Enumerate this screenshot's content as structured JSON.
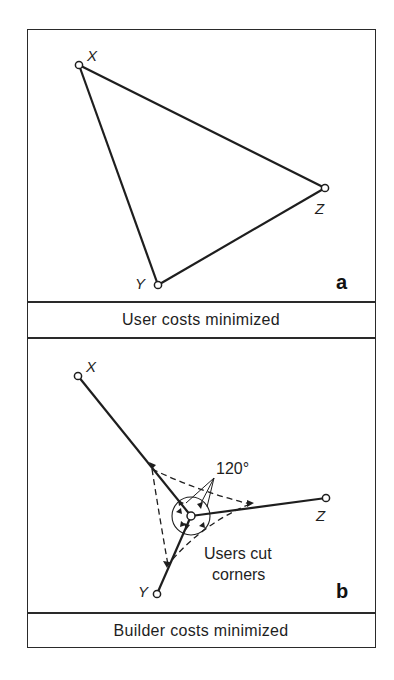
{
  "figure": {
    "panels": [
      {
        "id": "a",
        "letter": "a",
        "caption": "User costs minimized",
        "vertices": [
          {
            "label": "X",
            "x": 79,
            "y": 65
          },
          {
            "label": "Y",
            "x": 158,
            "y": 285
          },
          {
            "label": "Z",
            "x": 325,
            "y": 188
          }
        ],
        "edges": [
          [
            "X",
            "Z"
          ],
          [
            "X",
            "Y"
          ],
          [
            "Y",
            "Z"
          ]
        ]
      },
      {
        "id": "b",
        "letter": "b",
        "caption": "Builder costs minimized",
        "vertices": [
          {
            "label": "X",
            "x": 78,
            "y": 376
          },
          {
            "label": "Y",
            "x": 157,
            "y": 594
          },
          {
            "label": "Z",
            "x": 326,
            "y": 498
          }
        ],
        "junction": {
          "x": 191,
          "y": 516
        },
        "edges": [
          [
            "X",
            "junction"
          ],
          [
            "Y",
            "junction"
          ],
          [
            "Z",
            "junction"
          ]
        ],
        "angle_annotation": "120°",
        "shortcut_annotation_line1": "Users cut",
        "shortcut_annotation_line2": "corners"
      }
    ],
    "colors": {
      "line": "#1e1e1e",
      "background": "#ffffff"
    }
  }
}
